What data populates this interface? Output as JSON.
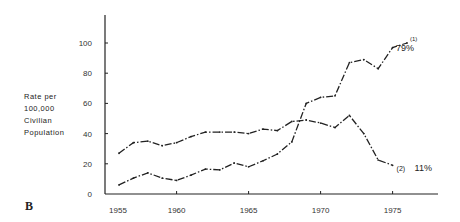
{
  "chart_data": {
    "type": "line",
    "title": "",
    "panel_label": "B",
    "xlabel": "",
    "ylabel_lines": [
      "Rate per",
      "100,000",
      "Civilian",
      "Population"
    ],
    "xlim": [
      1955,
      1977.5
    ],
    "ylim": [
      0,
      110
    ],
    "x_ticks": [
      1955,
      1960,
      1965,
      1970,
      1975
    ],
    "y_ticks": [
      0,
      20,
      40,
      60,
      80,
      100
    ],
    "grid": false,
    "series": [
      {
        "name": "(1)",
        "end_annotation": "79%",
        "style": "dash-dot",
        "x": [
          1956,
          1957,
          1958,
          1959,
          1960,
          1961,
          1962,
          1963,
          1964,
          1965,
          1966,
          1967,
          1968,
          1969,
          1970,
          1971,
          1972,
          1973,
          1974,
          1975,
          1976
        ],
        "values": [
          6,
          10.5,
          14,
          10.5,
          9,
          12.5,
          16.5,
          16,
          20.5,
          18,
          22,
          26.5,
          34.5,
          60,
          64,
          65,
          87,
          89,
          83,
          97,
          100
        ]
      },
      {
        "name": "(2)",
        "end_annotation": "11%",
        "style": "dash-dot",
        "x": [
          1956,
          1957,
          1958,
          1959,
          1960,
          1961,
          1962,
          1963,
          1964,
          1965,
          1966,
          1967,
          1968,
          1969,
          1970,
          1971,
          1972,
          1973,
          1974,
          1975
        ],
        "values": [
          27,
          34,
          35,
          32,
          34,
          38,
          41,
          41,
          41,
          40,
          43,
          42,
          48,
          49,
          47,
          44,
          52,
          40,
          22.5,
          19
        ]
      }
    ]
  }
}
